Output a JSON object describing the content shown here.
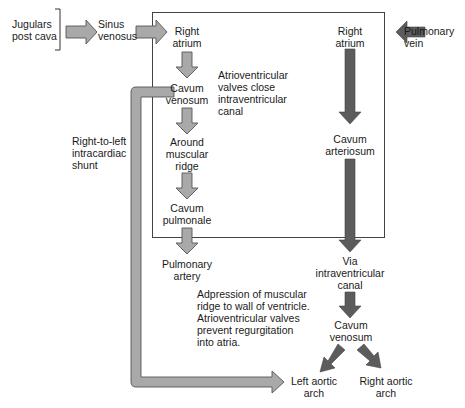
{
  "diagram": {
    "type": "flow",
    "colors": {
      "deoxygenated_arrow": "#a9a9a9",
      "oxygenated_arrow": "#5c5c5c",
      "arrow_outline": "#555555",
      "box_border": "#444444",
      "text": "#1a1a1a"
    },
    "nodes": {
      "jugulars": {
        "line1": "Jugulars",
        "line2": "post cava"
      },
      "sinus_venosus": {
        "line1": "Sinus",
        "line2": "venosus"
      },
      "right_atrium_left": {
        "line1": "Right",
        "line2": "atrium"
      },
      "cavum_venosum_left": {
        "line1": "Cavum",
        "line2": "venosum"
      },
      "around_ridge": {
        "line1": "Around",
        "line2": "muscular",
        "line3": "ridge"
      },
      "cavum_pulmonale": {
        "line1": "Cavum",
        "line2": "pulmonale"
      },
      "pulmonary_artery": {
        "line1": "Pulmonary",
        "line2": "artery"
      },
      "right_atrium_right": {
        "line1": "Right",
        "line2": "atrium"
      },
      "pulmonary_vein": {
        "line1": "Pulmonary",
        "line2": "vein"
      },
      "cavum_arteriosum": {
        "line1": "Cavum",
        "line2": "arteriosum"
      },
      "via_canal": {
        "line1": "Via",
        "line2": "intraventricular",
        "line3": "canal"
      },
      "cavum_venosum_right": {
        "line1": "Cavum",
        "line2": "venosum"
      },
      "left_aortic_arch": {
        "line1": "Left aortic",
        "line2": "arch"
      },
      "right_aortic_arch": {
        "line1": "Right aortic",
        "line2": "arch"
      }
    },
    "annotations": {
      "av_valves": {
        "line1": "Atrioventricular",
        "line2": "valves close",
        "line3": "intraventricular",
        "line4": "canal"
      },
      "shunt": {
        "line1": "Right-to-left",
        "line2": "intracardiac",
        "line3": "shunt"
      },
      "adpression": {
        "line1": "Adpression of muscular",
        "line2": "ridge to wall of ventricle.",
        "line3": "Atrioventricular valves",
        "line4": "prevent regurgitation",
        "line5": "into atria."
      }
    },
    "edges": [
      {
        "from": "jugulars",
        "to": "sinus_venosus",
        "style": "light"
      },
      {
        "from": "sinus_venosus",
        "to": "right_atrium_left",
        "style": "light"
      },
      {
        "from": "right_atrium_left",
        "to": "cavum_venosum_left",
        "style": "light"
      },
      {
        "from": "cavum_venosum_left",
        "to": "around_ridge",
        "style": "light"
      },
      {
        "from": "around_ridge",
        "to": "cavum_pulmonale",
        "style": "light"
      },
      {
        "from": "cavum_pulmonale",
        "to": "pulmonary_artery",
        "style": "light"
      },
      {
        "from": "cavum_venosum_left",
        "to": "left_aortic_arch",
        "style": "light",
        "label": "shunt"
      },
      {
        "from": "pulmonary_vein",
        "to": "right_atrium_right",
        "style": "dark"
      },
      {
        "from": "right_atrium_right",
        "to": "cavum_arteriosum",
        "style": "dark"
      },
      {
        "from": "cavum_arteriosum",
        "to": "via_canal",
        "style": "dark"
      },
      {
        "from": "via_canal",
        "to": "cavum_venosum_right",
        "style": "dark"
      },
      {
        "from": "cavum_venosum_right",
        "to": "left_aortic_arch",
        "style": "dark"
      },
      {
        "from": "cavum_venosum_right",
        "to": "right_aortic_arch",
        "style": "dark"
      }
    ]
  }
}
